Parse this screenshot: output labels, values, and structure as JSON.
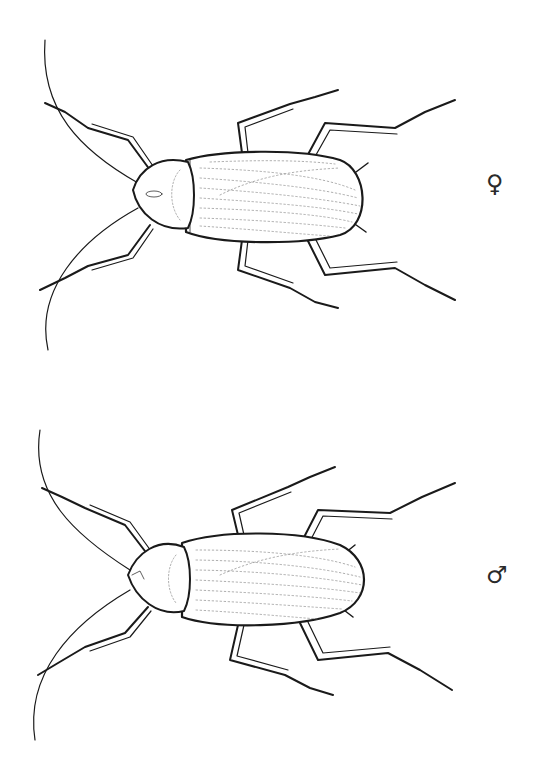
{
  "plate": {
    "description": "Dorsal-view line illustrations of a cockroach, female above and male below",
    "background_color": "#ffffff",
    "line_color": "#1a1a1a"
  },
  "specimens": [
    {
      "sex": "female",
      "symbol": "♀",
      "icon": "female-symbol-icon"
    },
    {
      "sex": "male",
      "symbol": "♂",
      "icon": "male-symbol-icon"
    }
  ]
}
